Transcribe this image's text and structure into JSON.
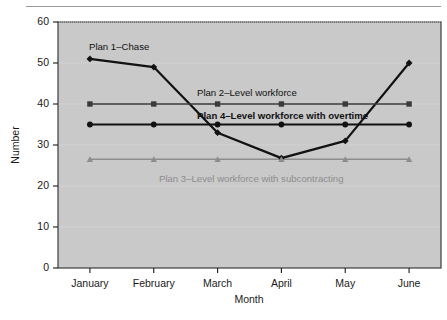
{
  "chart_data": {
    "type": "line",
    "title": "",
    "xlabel": "Month",
    "ylabel": "Number",
    "categories": [
      "January",
      "February",
      "March",
      "April",
      "May",
      "June"
    ],
    "ylim": [
      0,
      60
    ],
    "yticks": [
      0,
      10,
      20,
      30,
      40,
      50,
      60
    ],
    "ytick_labels": [
      "0",
      "10",
      "20",
      "30",
      "40",
      "50",
      "60"
    ],
    "grid": true,
    "grid_axis": "y",
    "legend": "inline-labels",
    "plot_background": "#c9c9c9",
    "series": [
      {
        "name": "Plan 1–Chase",
        "label": "Plan 1–Chase",
        "marker": "diamond",
        "color": "#111111",
        "line_width": 2.2,
        "values": [
          51,
          49,
          33,
          26.8,
          31,
          50
        ]
      },
      {
        "name": "Plan 2–Level workforce",
        "label": "Plan 2–Level workforce",
        "marker": "square",
        "color": "#3b3b3b",
        "line_width": 1.5,
        "values": [
          40,
          40,
          40,
          40,
          40,
          40
        ]
      },
      {
        "name": "Plan 4–Level workforce with overtime",
        "label": "Plan 4–Level workforce with overtime",
        "marker": "circle",
        "color": "#111111",
        "line_width": 2.0,
        "values": [
          35,
          35,
          35,
          35,
          35,
          35
        ]
      },
      {
        "name": "Plan 3–Level workforce with subcontracting",
        "label": "Plan 3–Level workforce with subcontracting",
        "marker": "triangle",
        "color": "#8d8d8d",
        "line_width": 1.5,
        "values": [
          26.5,
          26.5,
          26.5,
          26.5,
          26.5,
          26.5
        ]
      }
    ],
    "annotations": [
      {
        "text": "Plan 1–Chase",
        "x": 89,
        "y": 47
      },
      {
        "text": "Plan 2–Level workforce",
        "x": 197,
        "y": 93
      },
      {
        "text": "Plan 4–Level workforce with overtime",
        "x": 197,
        "y": 116
      },
      {
        "text": "Plan 3–Level workforce with subcontracting",
        "x": 159,
        "y": 179
      }
    ]
  }
}
